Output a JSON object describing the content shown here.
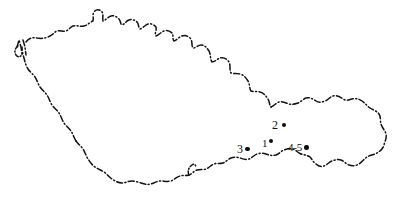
{
  "figure": {
    "kind": "hand-drawn outline map",
    "region": "Czechoslovakia",
    "background_color": "#ffffff",
    "ink_color": "#111111",
    "border_style": "dash-dot hand-drawn national boundary",
    "width": 397,
    "height": 205
  },
  "localities": [
    {
      "id": "locality-1",
      "label": "1",
      "label_side": "left",
      "dot_x": 272,
      "dot_y": 144,
      "dot_size": 4.5
    },
    {
      "id": "locality-2",
      "label": "2",
      "label_side": "left",
      "dot_x": 288,
      "dot_y": 126,
      "dot_size": 4.5
    },
    {
      "id": "locality-3",
      "label": "3",
      "label_side": "left",
      "dot_x": 251,
      "dot_y": 150,
      "dot_size": 4.5
    },
    {
      "id": "locality-4-5",
      "label": "4-5",
      "label_side": "left",
      "dot_x": 314,
      "dot_y": 148,
      "dot_size": 4.5
    }
  ]
}
